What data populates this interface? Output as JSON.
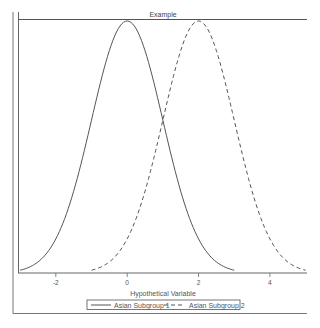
{
  "chart_data": {
    "type": "line",
    "title": "Example",
    "xlabel": "Hypothetical Variable",
    "ylabel": "",
    "xlim": [
      -3.06,
      5.04
    ],
    "ylim": [
      0,
      0.4
    ],
    "x_ticks": [
      -2,
      0,
      2,
      4
    ],
    "x_tick_labels": [
      "-2",
      "0",
      "2",
      "4"
    ],
    "y_ticks": [],
    "grid": false,
    "legend_position": "bottom",
    "series": [
      {
        "name": "Asian Subgroup 1",
        "style": "solid",
        "distribution": "normal",
        "mean": 0,
        "sd": 1,
        "x": [
          -3,
          -2.5,
          -2,
          -1.5,
          -1,
          -0.5,
          0,
          0.5,
          1,
          1.5,
          2,
          2.5,
          3
        ],
        "values": [
          0.0044,
          0.0175,
          0.054,
          0.1295,
          0.242,
          0.3521,
          0.3989,
          0.3521,
          0.242,
          0.1295,
          0.054,
          0.0175,
          0.0044
        ]
      },
      {
        "name": "Asian Subgroup 2",
        "style": "dashed",
        "distribution": "normal",
        "mean": 2,
        "sd": 1,
        "x": [
          -1,
          -0.5,
          0,
          0.5,
          1,
          1.5,
          2,
          2.5,
          3,
          3.5,
          4,
          4.5,
          5
        ],
        "values": [
          0.0044,
          0.0175,
          0.054,
          0.1295,
          0.242,
          0.3521,
          0.3989,
          0.3521,
          0.242,
          0.1295,
          0.054,
          0.0175,
          0.0044
        ]
      }
    ]
  },
  "colors": {
    "line": "#555555",
    "frame": "#666666",
    "background": "#ffffff"
  }
}
